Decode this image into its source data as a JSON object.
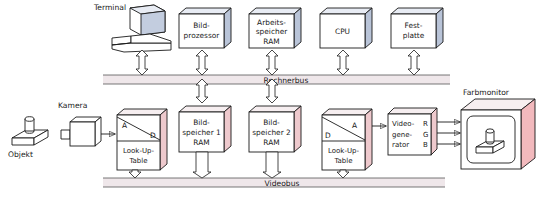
{
  "figure": {
    "kind": "block-diagram",
    "language": "de",
    "caption": ""
  },
  "colors": {
    "outline": "#1a1a1a",
    "box_face": "#ffffff",
    "box_top_blue": "#e8ecf4",
    "box_side_blue": "#b9c4d8",
    "box_top_pink": "#f6eef0",
    "box_side_pink": "#eec9cd",
    "bus_band": "#efe7ea",
    "bus_band_edge": "#cbbcc2",
    "arrow_fill": "#ffffff",
    "monitor_side": "#f2b9bd",
    "monitor_top": "#f7eff0"
  },
  "computer_row": {
    "label": "Rechnerbus",
    "units": [
      {
        "id": "terminal",
        "name": "Terminal",
        "shape": "terminal-illustration",
        "lines": []
      },
      {
        "id": "bildprozessor",
        "name": "Bildprozessor",
        "shape": "cube",
        "lines": [
          "Bild-",
          "prozessor"
        ]
      },
      {
        "id": "arbeitsspeicher",
        "name": "Arbeitsspeicher RAM",
        "shape": "cube",
        "lines": [
          "Arbeits-",
          "speicher",
          "RAM"
        ]
      },
      {
        "id": "cpu",
        "name": "CPU",
        "shape": "cube",
        "lines": [
          "CPU"
        ]
      },
      {
        "id": "festplatte",
        "name": "Festplatte",
        "shape": "cube",
        "lines": [
          "Fest-",
          "platte"
        ]
      }
    ]
  },
  "video_row": {
    "label": "Videobus",
    "units": [
      {
        "id": "lut_ad",
        "name": "Look-Up-Table A/D",
        "shape": "cube-split",
        "top_left": "A",
        "top_right": "D",
        "lines": [
          "Look-Up-",
          "Table"
        ]
      },
      {
        "id": "bildspeicher1",
        "name": "Bildspeicher 1 RAM",
        "shape": "cube",
        "lines": [
          "Bild-",
          "speicher 1",
          "RAM"
        ]
      },
      {
        "id": "bildspeicher2",
        "name": "Bildspeicher 2 RAM",
        "shape": "cube",
        "lines": [
          "Bild-",
          "speicher 2",
          "RAM"
        ]
      },
      {
        "id": "lut_da",
        "name": "Look-Up-Table D/A",
        "shape": "cube-split",
        "top_left": "D",
        "top_right": "A",
        "lines": [
          "Look-Up-",
          "Table"
        ]
      },
      {
        "id": "videogenerator",
        "name": "Videogenerator",
        "shape": "cube",
        "lines": [
          "Video-",
          "gene-",
          "rator"
        ],
        "outputs": [
          "R",
          "G",
          "B"
        ]
      }
    ]
  },
  "input_chain": {
    "object_label": "Objekt",
    "camera_label": "Kamera"
  },
  "output": {
    "monitor_label": "Farbmonitor"
  }
}
